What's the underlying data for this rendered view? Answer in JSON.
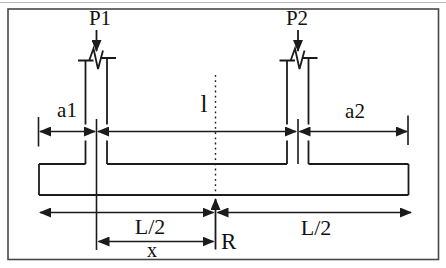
{
  "diagram": {
    "labels": {
      "p1": "P1",
      "p2": "P2",
      "a1": "a1",
      "a2": "a2",
      "span": "l",
      "half_length_left": "L/2",
      "half_length_right": "L/2",
      "x_dim": "x",
      "reaction": "R"
    },
    "colors": {
      "line": "#1b1b1b",
      "text": "#111111",
      "border": "#474747",
      "scan_line": "#b9b9b9",
      "background": "#ffffff"
    }
  }
}
